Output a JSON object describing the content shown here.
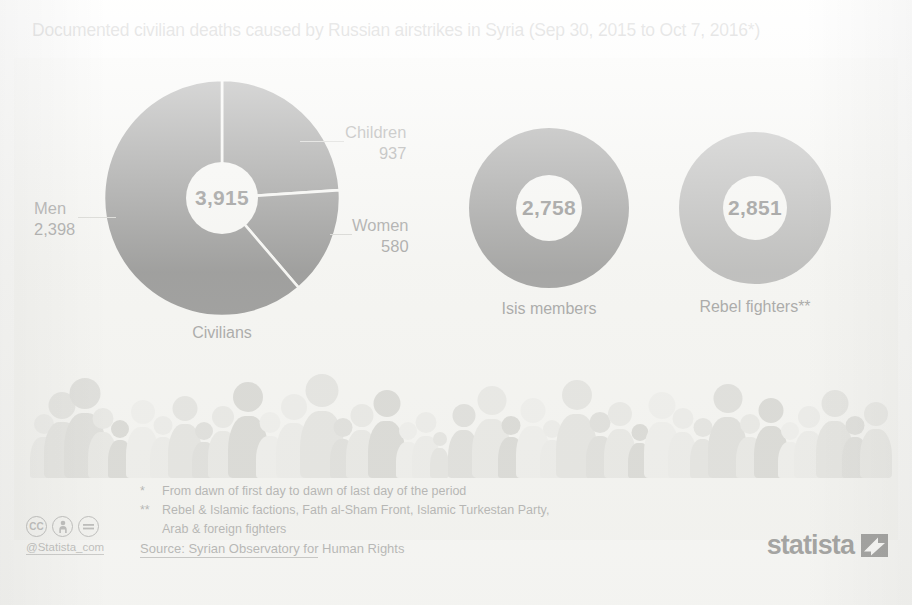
{
  "title": "Documented civilian deaths caused by Russian airstrikes in Syria (Sep 30, 2015 to Oct 7, 2016*)",
  "chart_data": {
    "type": "pie",
    "title": "Documented civilian deaths caused by Russian airstrikes in Syria (Sep 30, 2015 to Oct 7, 2016*)",
    "xlabel": "",
    "ylabel": "",
    "grid": false,
    "legend_position": "none",
    "charts": [
      {
        "name": "Civilians",
        "total": 3915,
        "total_label": "3,915",
        "caption": "Civilians",
        "color": "#4a4a4a",
        "categories": [
          "Children",
          "Women",
          "Men"
        ],
        "values": [
          937,
          580,
          2398
        ],
        "value_labels": [
          "937",
          "580",
          "2,398"
        ]
      },
      {
        "name": "Isis members",
        "total": 2758,
        "total_label": "2,758",
        "caption": "Isis members",
        "color": "#585858",
        "categories": [
          "Isis members"
        ],
        "values": [
          2758
        ],
        "value_labels": [
          "2,758"
        ]
      },
      {
        "name": "Rebel fighters",
        "total": 2851,
        "total_label": "2,851",
        "caption": "Rebel fighters**",
        "color": "#8a8a8a",
        "categories": [
          "Rebel fighters"
        ],
        "values": [
          2851
        ],
        "value_labels": [
          "2,851"
        ]
      }
    ]
  },
  "donuts": {
    "civilians": {
      "center": "3,915",
      "caption": "Civilians"
    },
    "isis": {
      "center": "2,758",
      "caption": "Isis members"
    },
    "rebels": {
      "center": "2,851",
      "caption": "Rebel fighters**"
    }
  },
  "callouts": {
    "children": {
      "label": "Children",
      "value": "937"
    },
    "women": {
      "label": "Women",
      "value": "580"
    },
    "men": {
      "label": "Men",
      "value": "2,398"
    }
  },
  "footnotes": [
    {
      "mark": "*",
      "text": "From dawn of first day to dawn of last day of the period"
    },
    {
      "mark": "**",
      "text": "Rebel & Islamic factions, Fath al-Sham Front, Islamic Turkestan Party,"
    },
    {
      "mark": "",
      "text": "Arab & foreign fighters"
    }
  ],
  "source": {
    "underlined": "Source: Syrian Observatory for",
    "rest": " Human Rights"
  },
  "license": {
    "badges": [
      "cc",
      "by-person",
      "nd-equals"
    ],
    "handle": "@Statista_com"
  },
  "brand": {
    "wordmark": "statista"
  },
  "colors": {
    "civilians": "#4a4a4a",
    "isis": "#585858",
    "rebels": "#8a8a8a",
    "background": "#f4f4f1",
    "text": "#5f5f5f"
  }
}
